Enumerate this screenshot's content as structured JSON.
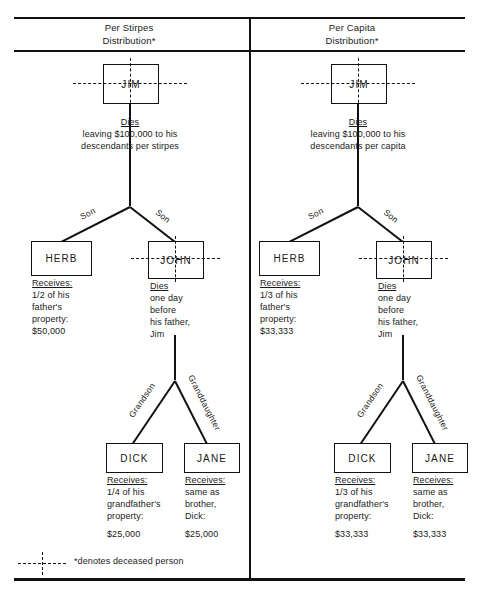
{
  "figure": {
    "footnote": "*denotes deceased person",
    "footnote_symbol_name": "dashed-cross-deceased-marker"
  },
  "columns": [
    {
      "id": "per-stirpes",
      "header_line1": "Per Stirpes",
      "header_line2": "Distribution*",
      "root": {
        "name": "JIM",
        "deceased": true,
        "caption_label": "Dies",
        "caption_line1": "leaving $100,000 to his",
        "caption_line2": "descendants per stirpes"
      },
      "edge_labels": {
        "child_left": "Son",
        "child_right": "Son",
        "grandchild_left": "Grandson",
        "grandchild_right": "Granddaughter"
      },
      "children": [
        {
          "name": "HERB",
          "deceased": false,
          "caption_label": "Receives:",
          "caption_lines": [
            "1/2 of his",
            "father's",
            "property:",
            "$50,000"
          ]
        },
        {
          "name": "JOHN",
          "deceased": true,
          "caption_label": "Dies",
          "caption_lines": [
            "one day",
            "before",
            "his father,",
            "Jim"
          ]
        }
      ],
      "grandchildren": [
        {
          "name": "DICK",
          "caption_label": "Receives:",
          "caption_lines": [
            "1/4 of his",
            "grandfather's",
            "property:"
          ],
          "amount": "$25,000"
        },
        {
          "name": "JANE",
          "caption_label": "Receives:",
          "caption_lines": [
            "same as",
            "brother,",
            "Dick:"
          ],
          "amount": "$25,000"
        }
      ]
    },
    {
      "id": "per-capita",
      "header_line1": "Per Capita",
      "header_line2": "Distribution*",
      "root": {
        "name": "JIM",
        "deceased": true,
        "caption_label": "Dies",
        "caption_line1": "leaving $100,000 to his",
        "caption_line2": "descendants per capita"
      },
      "edge_labels": {
        "child_left": "Son",
        "child_right": "Son",
        "grandchild_left": "Grandson",
        "grandchild_right": "Granddaughter"
      },
      "children": [
        {
          "name": "HERB",
          "deceased": false,
          "caption_label": "Receives:",
          "caption_lines": [
            "1/3 of his",
            "father's",
            "property:",
            "$33,333"
          ]
        },
        {
          "name": "JOHN",
          "deceased": true,
          "caption_label": "Dies",
          "caption_lines": [
            "one day",
            "before",
            "his father,",
            "Jim"
          ]
        }
      ],
      "grandchildren": [
        {
          "name": "DICK",
          "caption_label": "Receives:",
          "caption_lines": [
            "1/3 of his",
            "grandfather's",
            "property:"
          ],
          "amount": "$33,333"
        },
        {
          "name": "JANE",
          "caption_label": "Receives:",
          "caption_lines": [
            "same as",
            "brother,",
            "Dick:"
          ],
          "amount": "$33,333"
        }
      ]
    }
  ],
  "colors": {
    "ink": "#111111",
    "paper": "#ffffff"
  }
}
